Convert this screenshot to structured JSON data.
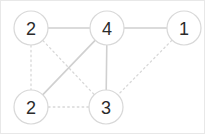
{
  "figure": {
    "title": "",
    "background_color": "#ffffff",
    "border_color": "#e8e8e8",
    "width": 205,
    "height": 134
  },
  "style": {
    "node_fill": "#ffffff",
    "node_stroke": "#d8d8d8",
    "label_color": "#2b2b2b",
    "edge_solid_color": "#d0d0d0",
    "edge_dotted_color": "#d8d8d8"
  },
  "chart_data": {
    "type": "diagram",
    "diagram_kind": "node-link-graph",
    "title": "",
    "xlabel": "",
    "ylabel": "",
    "grid": false,
    "legend": "none",
    "nodes": [
      {
        "id": "n1",
        "label": "2",
        "x": 30,
        "y": 27,
        "r": 17
      },
      {
        "id": "n2",
        "label": "4",
        "x": 106,
        "y": 27,
        "r": 17
      },
      {
        "id": "n3",
        "label": "1",
        "x": 183,
        "y": 27,
        "r": 17
      },
      {
        "id": "n4",
        "label": "2",
        "x": 30,
        "y": 106,
        "r": 17
      },
      {
        "id": "n5",
        "label": "3",
        "x": 105,
        "y": 106,
        "r": 17
      }
    ],
    "edges": [
      {
        "source": "n1",
        "target": "n2",
        "style": "solid"
      },
      {
        "source": "n2",
        "target": "n3",
        "style": "solid"
      },
      {
        "source": "n2",
        "target": "n5",
        "style": "solid"
      },
      {
        "source": "n4",
        "target": "n2",
        "style": "solid"
      },
      {
        "source": "n1",
        "target": "n4",
        "style": "dotted"
      },
      {
        "source": "n1",
        "target": "n5",
        "style": "dotted"
      },
      {
        "source": "n4",
        "target": "n5",
        "style": "dotted"
      },
      {
        "source": "n3",
        "target": "n5",
        "style": "dotted"
      }
    ]
  }
}
